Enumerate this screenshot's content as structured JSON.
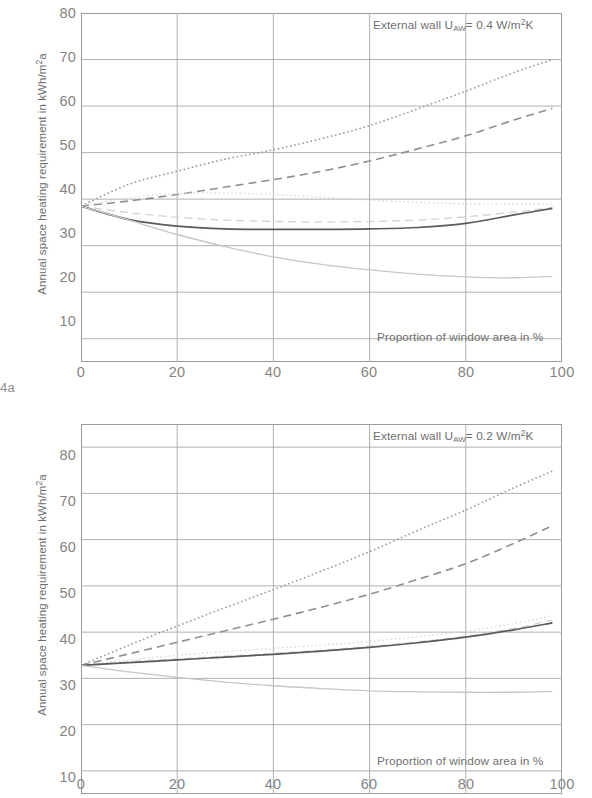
{
  "figure": {
    "label": "4a"
  },
  "charts": [
    {
      "id": "chart-a",
      "annotation_top": "External wall U",
      "annotation_sub": "AW",
      "annotation_rest": "= 0.4 W/m",
      "annotation_sup": "2",
      "annotation_tail": "K",
      "annotation_full": "External wall UAW= 0.4 W/m2K",
      "xlabel": "Proportion of window area in %",
      "ylabel_a": "Annual space heating requirement in kWh/m",
      "ylabel_sup": "2",
      "ylabel_tail": "a",
      "ylabel_full": "Annual space heating requirement in kWh/m2a",
      "yticks": [
        80,
        70,
        60,
        50,
        40,
        30,
        20,
        10
      ],
      "xticks": [
        0,
        20,
        40,
        60,
        80,
        100
      ]
    },
    {
      "id": "chart-b",
      "annotation_top": "External wall U",
      "annotation_sub": "AW",
      "annotation_rest": "= 0.2 W/m",
      "annotation_sup": "2",
      "annotation_tail": "K",
      "annotation_full": "External wall UAW= 0.2 W/m2K",
      "xlabel": "Proportion of window area in %",
      "ylabel_a": "Annual space heating requirement in kWh/m",
      "ylabel_sup": "2",
      "ylabel_tail": "a",
      "ylabel_full": "Annual space heating requirement in kWh/m2a",
      "yticks": [
        80,
        70,
        60,
        50,
        40,
        30,
        20,
        10
      ],
      "xticks": [
        0,
        20,
        40,
        60,
        80,
        100
      ]
    }
  ],
  "chart_data": [
    {
      "type": "line",
      "id": "chart-a",
      "title": "External wall U_AW = 0.4 W/m²K",
      "xlabel": "Proportion of window area in %",
      "ylabel": "Annual space heating requirement in kWh/m²a",
      "xlim": [
        0,
        100
      ],
      "ylim": [
        5,
        80
      ],
      "xticks": [
        0,
        20,
        40,
        60,
        80,
        100
      ],
      "yticks": [
        10,
        20,
        30,
        40,
        50,
        60,
        70,
        80
      ],
      "grid": true,
      "legend": "none",
      "x": [
        0,
        10,
        20,
        30,
        40,
        50,
        60,
        70,
        80,
        90,
        98
      ],
      "series": [
        {
          "name": "dark-dotted",
          "style": "dotted",
          "color": "#9a9a9a",
          "width": 1.6,
          "values": [
            38.5,
            43.2,
            46.0,
            48.6,
            50.6,
            53.0,
            55.8,
            59.4,
            63.2,
            67.2,
            70.0
          ]
        },
        {
          "name": "dark-dashed",
          "style": "dashed",
          "color": "#8f8f8f",
          "width": 1.6,
          "values": [
            38.5,
            39.6,
            41.0,
            42.6,
            44.2,
            46.0,
            48.2,
            50.8,
            53.6,
            57.0,
            59.5
          ]
        },
        {
          "name": "light-dotted",
          "style": "dotted",
          "color": "#d8d8d8",
          "width": 1.3,
          "values": [
            38.5,
            40.3,
            41.2,
            41.3,
            41.0,
            40.4,
            39.8,
            39.3,
            39.0,
            38.9,
            39.0
          ]
        },
        {
          "name": "light-dashed",
          "style": "dashed",
          "color": "#d2d2d2",
          "width": 1.3,
          "values": [
            38.5,
            37.1,
            36.1,
            35.5,
            35.2,
            35.1,
            35.2,
            35.5,
            36.2,
            37.2,
            38.2
          ]
        },
        {
          "name": "dark-solid",
          "style": "solid",
          "color": "#5a5a5a",
          "width": 1.7,
          "values": [
            38.5,
            35.6,
            34.2,
            33.6,
            33.5,
            33.5,
            33.6,
            33.9,
            34.8,
            36.6,
            38.0
          ]
        },
        {
          "name": "light-solid",
          "style": "solid",
          "color": "#c6c6c6",
          "width": 1.3,
          "values": [
            38.5,
            35.5,
            32.4,
            29.8,
            27.6,
            26.0,
            24.8,
            23.9,
            23.3,
            23.1,
            23.4
          ]
        }
      ]
    },
    {
      "type": "line",
      "id": "chart-b",
      "title": "External wall U_AW = 0.2 W/m²K",
      "xlabel": "Proportion of window area in %",
      "ylabel": "Annual space heating requirement in kWh/m²a",
      "xlim": [
        0,
        100
      ],
      "ylim": [
        5,
        85
      ],
      "xticks": [
        0,
        20,
        40,
        60,
        80,
        100
      ],
      "yticks": [
        10,
        20,
        30,
        40,
        50,
        60,
        70,
        80
      ],
      "grid": true,
      "legend": "none",
      "x": [
        0,
        10,
        20,
        30,
        40,
        50,
        60,
        70,
        80,
        90,
        98
      ],
      "series": [
        {
          "name": "dark-dotted",
          "style": "dotted",
          "color": "#9a9a9a",
          "width": 1.6,
          "values": [
            32.8,
            37.2,
            41.3,
            45.3,
            49.2,
            53.2,
            57.4,
            62.0,
            66.4,
            71.2,
            74.8
          ]
        },
        {
          "name": "dark-dashed",
          "style": "dashed",
          "color": "#8f8f8f",
          "width": 1.6,
          "values": [
            32.8,
            35.3,
            37.8,
            40.3,
            42.8,
            45.4,
            48.2,
            51.4,
            54.8,
            59.2,
            63.0
          ]
        },
        {
          "name": "light-dotted",
          "style": "dotted",
          "color": "#d8d8d8",
          "width": 1.3,
          "values": [
            32.8,
            34.0,
            35.0,
            35.8,
            36.5,
            37.2,
            38.0,
            39.0,
            40.2,
            41.8,
            43.6
          ]
        },
        {
          "name": "light-dashed",
          "style": "dashed",
          "color": "#d2d2d2",
          "width": 1.3,
          "values": [
            32.8,
            33.6,
            34.2,
            34.8,
            35.4,
            36.1,
            36.9,
            37.9,
            39.1,
            40.8,
            42.6
          ]
        },
        {
          "name": "dark-solid",
          "style": "solid",
          "color": "#5a5a5a",
          "width": 1.7,
          "values": [
            32.8,
            33.4,
            34.0,
            34.6,
            35.2,
            35.9,
            36.7,
            37.7,
            38.9,
            40.5,
            42.0
          ]
        },
        {
          "name": "light-solid",
          "style": "solid",
          "color": "#c6c6c6",
          "width": 1.3,
          "values": [
            32.8,
            31.4,
            30.2,
            29.2,
            28.4,
            27.8,
            27.3,
            27.1,
            27.0,
            27.0,
            27.2
          ]
        }
      ]
    }
  ]
}
